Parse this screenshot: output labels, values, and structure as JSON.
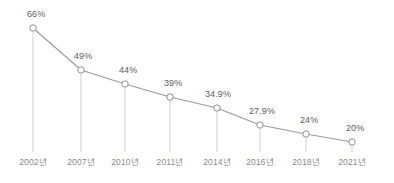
{
  "chart_data": {
    "type": "line",
    "title": "",
    "subtitle": "",
    "xlabel": "",
    "ylabel": "",
    "categories": [
      "2002년",
      "2007년",
      "2010년",
      "2011년",
      "2014년",
      "2016년",
      "2018년",
      "2021년"
    ],
    "values": [
      66,
      49,
      44,
      39,
      34.9,
      27.9,
      24,
      20
    ],
    "point_labels": [
      "66%",
      "49%",
      "44%",
      "39%",
      "34.9%",
      "27.9%",
      "24%",
      "20%"
    ],
    "ylim": [
      0,
      70
    ],
    "xlim": [
      0,
      7
    ],
    "grid": false,
    "legend": null,
    "legend_position": "none",
    "annotations": [],
    "series": [
      {
        "name": "",
        "values": [
          66,
          49,
          44,
          39,
          34.9,
          27.9,
          24,
          20
        ]
      }
    ],
    "style": {
      "line_color": "#9a9a9a",
      "marker_fill": "#ffffff",
      "marker_stroke": "#8f8f8f",
      "dropline_color": "#c9c9c9",
      "label_color": "#5d5d5d",
      "tick_color": "#8a8a8a",
      "background": "#ffffff"
    }
  },
  "points": [
    {
      "label": "66%",
      "tick": "2002년",
      "x": 33,
      "y": 28,
      "label_x": 27,
      "label_y": 9,
      "tick_x": 33,
      "drop_to": 152
    },
    {
      "label": "49%",
      "tick": "2007년",
      "x": 81,
      "y": 70,
      "label_x": 74,
      "label_y": 51,
      "tick_x": 81,
      "drop_to": 152
    },
    {
      "label": "44%",
      "tick": "2010년",
      "x": 125,
      "y": 84,
      "label_x": 119,
      "label_y": 65,
      "tick_x": 125,
      "drop_to": 152
    },
    {
      "label": "39%",
      "tick": "2011년",
      "x": 170,
      "y": 97,
      "label_x": 164,
      "label_y": 78,
      "tick_x": 170,
      "drop_to": 152
    },
    {
      "label": "34.9%",
      "tick": "2014년",
      "x": 217,
      "y": 108,
      "label_x": 205,
      "label_y": 89,
      "tick_x": 217,
      "drop_to": 152
    },
    {
      "label": "27.9%",
      "tick": "2016년",
      "x": 260,
      "y": 125,
      "label_x": 249,
      "label_y": 106,
      "tick_x": 260,
      "drop_to": 152
    },
    {
      "label": "24%",
      "tick": "2018년",
      "x": 306,
      "y": 134,
      "label_x": 300,
      "label_y": 115,
      "tick_x": 306,
      "drop_to": 152
    },
    {
      "label": "20%",
      "tick": "2021년",
      "x": 352,
      "y": 142,
      "label_x": 346,
      "label_y": 123,
      "tick_x": 352,
      "drop_to": 152
    }
  ],
  "tick_label_y": 157
}
